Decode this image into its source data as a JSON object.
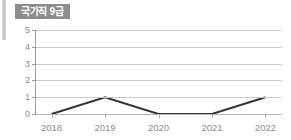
{
  "badge": {
    "label": "국가직 9급",
    "background_color": "#8c8c8c",
    "text_color": "#ffffff"
  },
  "colors": {
    "page_background": "#ffffff",
    "gridline": "#c9c9c9",
    "axis": "#9a9a9a",
    "tick_label": "#8a8a8a",
    "series_line": "#333333"
  },
  "chart_data": {
    "type": "line",
    "title": "국가직 9급",
    "xlabel": "",
    "ylabel": "",
    "categories": [
      "2018",
      "2019",
      "2020",
      "2021",
      "2022"
    ],
    "values": [
      0,
      1,
      0,
      0,
      1
    ],
    "series": [
      {
        "name": "국가직 9급",
        "values": [
          0,
          1,
          0,
          0,
          1
        ],
        "color": "#333333"
      }
    ],
    "ylim": [
      0,
      5
    ],
    "y_ticks": [
      "0",
      "1",
      "2",
      "3",
      "4",
      "5"
    ],
    "y_tick_values": [
      0,
      1,
      2,
      3,
      4,
      5
    ],
    "grid": true,
    "legend": false,
    "markers": false
  }
}
